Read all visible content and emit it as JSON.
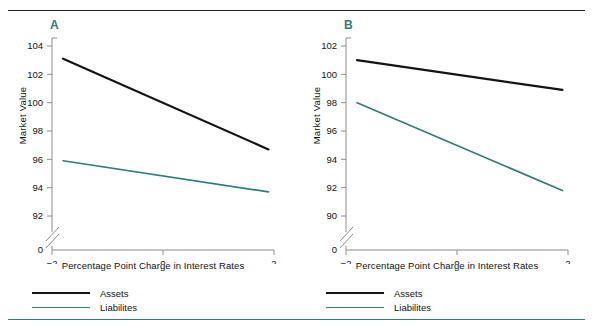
{
  "figure": {
    "rule_top_color": "#1c1c1c",
    "rule_bottom_color": "#2e7d78"
  },
  "colors": {
    "assets": "#141414",
    "liabilities": "#2e7d78",
    "panel_letter": "#2e7d78",
    "axis": "#8c8c8c",
    "text": "#111111"
  },
  "panels": [
    {
      "letter": "A",
      "xlabel": "Percentage Point Charge in Interest Rates",
      "ylabel": "Market Value",
      "xticks": [
        "-2",
        "0",
        "2"
      ],
      "yticks": [
        "104",
        "102",
        "100",
        "98",
        "96",
        "94",
        "92",
        "0"
      ],
      "legend": [
        {
          "label": "Assets",
          "color": "#141414"
        },
        {
          "label": "Liabilites",
          "color": "#2e7d78"
        }
      ]
    },
    {
      "letter": "B",
      "xlabel": "Percentage Point Charge in Interest Rates",
      "ylabel": "Market Value",
      "xticks": [
        "-2",
        "0",
        "2"
      ],
      "yticks": [
        "102",
        "100",
        "98",
        "96",
        "94",
        "92",
        "90",
        "0"
      ],
      "legend": [
        {
          "label": "Assets",
          "color": "#141414"
        },
        {
          "label": "Liabilites",
          "color": "#2e7d78"
        }
      ]
    }
  ],
  "chart_data": [
    {
      "type": "line",
      "panel": "A",
      "title": "A",
      "xlabel": "Percentage Point Charge in Interest Rates",
      "ylabel": "Market Value",
      "xlim": [
        -2,
        2
      ],
      "ylim": [
        91,
        104.6
      ],
      "xticks": [
        -2,
        0,
        2
      ],
      "yticks": [
        92,
        94,
        96,
        98,
        100,
        102,
        104
      ],
      "y_axis_break": true,
      "y_axis_break_label": "0",
      "grid": false,
      "legend_position": "below-left",
      "series": [
        {
          "name": "Assets",
          "color": "#141414",
          "x": [
            -1.8,
            1.9
          ],
          "values": [
            103.1,
            96.7
          ]
        },
        {
          "name": "Liabilites",
          "color": "#2e7d78",
          "x": [
            -1.8,
            1.9
          ],
          "values": [
            95.9,
            93.7
          ]
        }
      ]
    },
    {
      "type": "line",
      "panel": "B",
      "title": "B",
      "xlabel": "Percentage Point Charge in Interest Rates",
      "ylabel": "Market Value",
      "xlim": [
        -2,
        2
      ],
      "ylim": [
        89,
        102.6
      ],
      "xticks": [
        -2,
        0,
        2
      ],
      "yticks": [
        90,
        92,
        94,
        96,
        98,
        100,
        102
      ],
      "y_axis_break": true,
      "y_axis_break_label": "0",
      "grid": false,
      "legend_position": "below-left",
      "series": [
        {
          "name": "Assets",
          "color": "#141414",
          "x": [
            -1.8,
            1.9
          ],
          "values": [
            101.0,
            98.9
          ]
        },
        {
          "name": "Liabilites",
          "color": "#2e7d78",
          "x": [
            -1.8,
            1.9
          ],
          "values": [
            98.0,
            91.8
          ]
        }
      ]
    }
  ]
}
